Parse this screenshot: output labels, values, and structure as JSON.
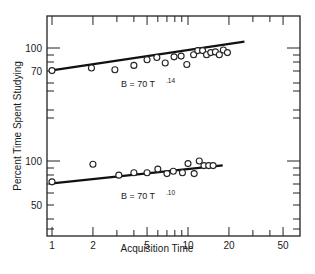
{
  "chart_data": {
    "type": "scatter",
    "title": "",
    "xlabel": "Acquisition Time",
    "ylabel": "Percent Time Spent Studying",
    "xscale": "log",
    "yscale": "log",
    "xlim": [
      0.95,
      60
    ],
    "x_ticks": [
      1,
      2,
      5,
      10,
      20,
      50
    ],
    "x_tick_labels": [
      "1",
      "2",
      "5",
      "10",
      "20",
      "50"
    ],
    "grid": false,
    "legend": null,
    "panels": [
      {
        "name": "upper",
        "y_tick_labels": [
          "100",
          "70"
        ],
        "y_ticks": [
          100,
          70
        ],
        "equation": "B = 70 T",
        "exponent": ".14",
        "fit": {
          "a": 70,
          "b": 0.14,
          "x_range": [
            1,
            26
          ]
        },
        "points": [
          {
            "x": 1.0,
            "y": 70
          },
          {
            "x": 1.95,
            "y": 73
          },
          {
            "x": 2.9,
            "y": 71
          },
          {
            "x": 4.0,
            "y": 76
          },
          {
            "x": 5.0,
            "y": 83
          },
          {
            "x": 5.9,
            "y": 86
          },
          {
            "x": 6.8,
            "y": 79
          },
          {
            "x": 7.9,
            "y": 87
          },
          {
            "x": 8.9,
            "y": 88
          },
          {
            "x": 9.8,
            "y": 77
          },
          {
            "x": 11.0,
            "y": 90
          },
          {
            "x": 11.8,
            "y": 96
          },
          {
            "x": 12.8,
            "y": 96
          },
          {
            "x": 13.7,
            "y": 90
          },
          {
            "x": 14.7,
            "y": 93
          },
          {
            "x": 15.9,
            "y": 94
          },
          {
            "x": 17.0,
            "y": 90
          },
          {
            "x": 18.2,
            "y": 97
          },
          {
            "x": 19.5,
            "y": 93
          }
        ]
      },
      {
        "name": "lower",
        "y_tick_labels": [
          "100",
          "50"
        ],
        "y_ticks": [
          100,
          50
        ],
        "equation": "B = 70 T",
        "exponent": ".10",
        "fit": {
          "a": 70,
          "b": 0.1,
          "x_range": [
            1,
            18
          ]
        },
        "points": [
          {
            "x": 1.0,
            "y": 72
          },
          {
            "x": 2.0,
            "y": 95
          },
          {
            "x": 3.1,
            "y": 80
          },
          {
            "x": 4.0,
            "y": 83
          },
          {
            "x": 5.0,
            "y": 83
          },
          {
            "x": 6.0,
            "y": 88
          },
          {
            "x": 7.0,
            "y": 82
          },
          {
            "x": 7.8,
            "y": 85
          },
          {
            "x": 9.1,
            "y": 83
          },
          {
            "x": 10.0,
            "y": 96
          },
          {
            "x": 11.1,
            "y": 82
          },
          {
            "x": 12.1,
            "y": 100
          },
          {
            "x": 13.1,
            "y": 93
          },
          {
            "x": 14.2,
            "y": 93
          },
          {
            "x": 15.3,
            "y": 93
          }
        ]
      }
    ]
  }
}
